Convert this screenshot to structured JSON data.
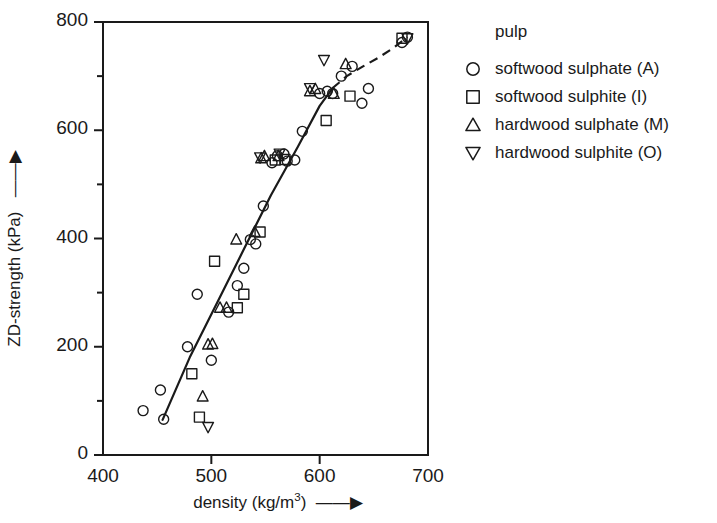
{
  "chart_data": {
    "type": "scatter",
    "title": "",
    "xlabel": "density (kg/m3)",
    "xlabel_base": "density (kg/m",
    "xlabel_sup": "3",
    "xlabel_tail": ")",
    "ylabel": "ZD-strength (kPa)",
    "xlim": [
      400,
      700
    ],
    "ylim": [
      0,
      800
    ],
    "x_ticks": [
      400,
      500,
      600,
      700
    ],
    "x_tick_labels": [
      "400",
      "500",
      "600",
      "700"
    ],
    "x_minor_ticks": [
      450,
      550,
      650
    ],
    "y_ticks": [
      0,
      200,
      400,
      600,
      800
    ],
    "y_tick_labels": [
      "0",
      "200",
      "400",
      "600",
      "800"
    ],
    "y_minor_ticks": [
      100,
      300,
      500,
      700
    ],
    "grid": false,
    "legend_position": "right",
    "marker_style": "open",
    "marker_color": "#1a1a1a",
    "series": [
      {
        "name": "softwood sulphate (A)",
        "code": "A",
        "marker": "circle",
        "points": [
          [
            437,
            82
          ],
          [
            453,
            120
          ],
          [
            456,
            66
          ],
          [
            478,
            200
          ],
          [
            487,
            297
          ],
          [
            500,
            175
          ],
          [
            516,
            264
          ],
          [
            524,
            313
          ],
          [
            530,
            345
          ],
          [
            536,
            398
          ],
          [
            541,
            390
          ],
          [
            548,
            460
          ],
          [
            556,
            540
          ],
          [
            561,
            553
          ],
          [
            567,
            556
          ],
          [
            570,
            543
          ],
          [
            577,
            545
          ],
          [
            584,
            598
          ],
          [
            600,
            668
          ],
          [
            607,
            672
          ],
          [
            612,
            668
          ],
          [
            620,
            700
          ],
          [
            630,
            718
          ],
          [
            639,
            650
          ],
          [
            645,
            677
          ],
          [
            676,
            762
          ],
          [
            681,
            772
          ]
        ]
      },
      {
        "name": "softwood sulphite (I)",
        "code": "I",
        "marker": "square",
        "points": [
          [
            482,
            150
          ],
          [
            489,
            70
          ],
          [
            503,
            358
          ],
          [
            524,
            272
          ],
          [
            530,
            297
          ],
          [
            545,
            412
          ],
          [
            559,
            545
          ],
          [
            568,
            546
          ],
          [
            606,
            618
          ],
          [
            628,
            663
          ],
          [
            676,
            770
          ]
        ]
      },
      {
        "name": "hardwood sulphate (M)",
        "code": "M",
        "marker": "triangle-up",
        "points": [
          [
            492,
            108
          ],
          [
            497,
            204
          ],
          [
            501,
            205
          ],
          [
            508,
            272
          ],
          [
            514,
            272
          ],
          [
            523,
            398
          ],
          [
            540,
            412
          ],
          [
            546,
            548
          ],
          [
            549,
            552
          ],
          [
            562,
            552
          ],
          [
            591,
            672
          ],
          [
            596,
            676
          ],
          [
            613,
            667
          ],
          [
            624,
            722
          ]
        ]
      },
      {
        "name": "hardwood sulphite (O)",
        "code": "O",
        "marker": "triangle-down",
        "points": [
          [
            497,
            52
          ],
          [
            545,
            550
          ],
          [
            563,
            557
          ],
          [
            591,
            678
          ],
          [
            604,
            730
          ],
          [
            681,
            770
          ]
        ]
      }
    ],
    "trend_line": {
      "solid_segment": [
        [
          455,
          65
        ],
        [
          480,
          180
        ],
        [
          505,
          280
        ],
        [
          530,
          380
        ],
        [
          555,
          480
        ],
        [
          580,
          570
        ],
        [
          600,
          645
        ],
        [
          612,
          678
        ]
      ],
      "dashed_segment": [
        [
          612,
          678
        ],
        [
          625,
          700
        ],
        [
          640,
          718
        ],
        [
          655,
          735
        ],
        [
          668,
          752
        ],
        [
          681,
          772
        ]
      ]
    }
  },
  "legend": {
    "title": "pulp",
    "entries": [
      {
        "marker": "circle",
        "label": "softwood sulphate (A)"
      },
      {
        "marker": "square",
        "label": "softwood sulphite (I)"
      },
      {
        "marker": "triangle-up",
        "label": "hardwood sulphate (M)"
      },
      {
        "marker": "triangle-down",
        "label": "hardwood sulphite (O)"
      }
    ]
  }
}
